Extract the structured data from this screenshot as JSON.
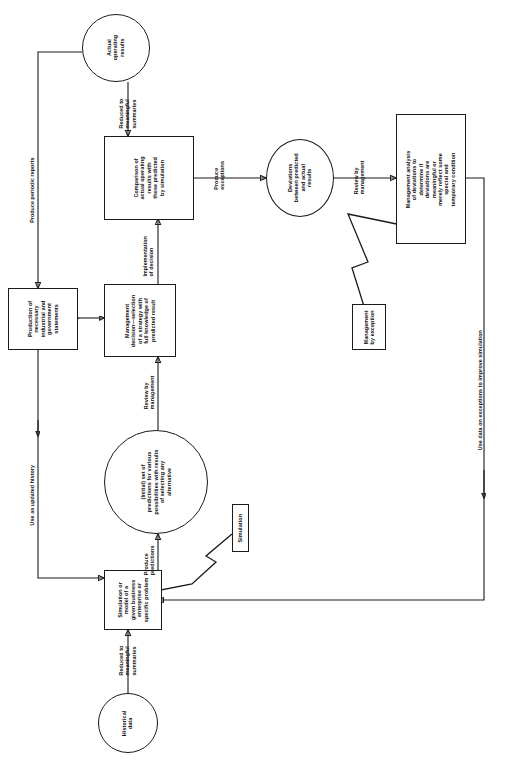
{
  "diagram": {
    "orientation": "text-rotated-90-ccw",
    "background_color": "#ffffff",
    "line_color": "#1a1a1a"
  },
  "nodes": {
    "actual_operating_results": "Actual\noperating\nresults",
    "comparison": "Comparison of\nactual operating\nresults with\nthose predicted\nby simulation",
    "deviations": "Deviations\nbetween predicted\nand actual\nresults",
    "management_analysis": "Management analysis\nof deviations to\ndetermine if\ndeviations are\nmeaningful or\nmerely reflect some\nspecial and\ntemporary condition",
    "production_statements": "Production of\nnecessary\nindustrial and\ngovernment\nstatements",
    "management_decision": "Management\ndecision—selection\nof a strategy with\nfull knowledge of\npredicted result",
    "initial_predictions": "(Initial) set of\npredictions for various\npossibilities with results\nof selecting any\nalternative",
    "simulation_model": "Simulation or\nmodel of a\ngiven business\nenterprise or\nspecific problem",
    "historical_data": "Historical\ndata",
    "management_by_exception_tag": "Management\nby exception",
    "simulation_tag": "Simulation"
  },
  "edge_labels": {
    "reduced_to_summaries_top": "Reduced to\nmeaningful\nsummaries",
    "produce_exceptions": "Produce\nexceptions",
    "review_by_management_top": "Review by\nmanagement",
    "produce_periodic_reports": "Produce periodic reports",
    "implementation_of_decision": "Implementation\nof decision",
    "review_by_management_lower": "Review by\nmanagement",
    "produce_predictions": "Produce\npredictions",
    "use_as_updated_history": "Use as updated history",
    "reduced_to_summaries_bottom": "Reduced to\nmeaningful\nsummaries",
    "use_data_on_exceptions": "Use data on exceptions to improve simulation"
  }
}
